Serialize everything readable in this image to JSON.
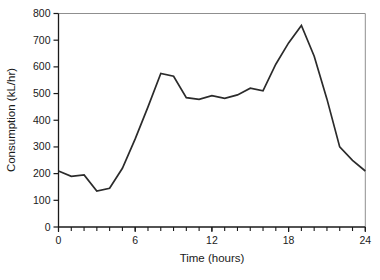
{
  "figure": {
    "background": "#ffffff"
  },
  "chart_data": {
    "type": "line",
    "title": "",
    "xlabel": "Time (hours)",
    "ylabel": "Consumption (kL/hr)",
    "series_name": "hourly-consumption",
    "x": [
      0,
      1,
      2,
      3,
      4,
      5,
      6,
      7,
      8,
      9,
      10,
      11,
      12,
      13,
      14,
      15,
      16,
      17,
      18,
      19,
      20,
      21,
      22,
      23,
      24
    ],
    "values": [
      210,
      190,
      195,
      135,
      145,
      220,
      330,
      450,
      575,
      565,
      485,
      478,
      492,
      482,
      495,
      520,
      510,
      610,
      690,
      755,
      640,
      480,
      300,
      250,
      210
    ],
    "xlim": [
      0,
      24
    ],
    "ylim": [
      0,
      800
    ],
    "xticks_labeled": [
      0,
      6,
      12,
      18,
      24
    ],
    "xtick_minor_step": 1,
    "yticks": [
      0,
      100,
      200,
      300,
      400,
      500,
      600,
      700,
      800
    ],
    "grid": false,
    "legend": null,
    "line_color": "#2b2b2b",
    "axis_color": "#1a1a1a",
    "box_color": "#8f8f8f",
    "text_color": "#1a1a1a"
  }
}
